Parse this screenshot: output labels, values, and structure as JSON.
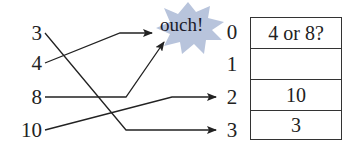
{
  "keys": [
    {
      "label": "3",
      "y": 33
    },
    {
      "label": "4",
      "y": 63
    },
    {
      "label": "8",
      "y": 97
    },
    {
      "label": "10",
      "y": 130
    }
  ],
  "callout": {
    "label": "ouch!",
    "color": "#b8c4dc"
  },
  "indices": [
    "0",
    "1",
    "2",
    "3"
  ],
  "table": {
    "cells": [
      "4 or 8?",
      "",
      "10",
      "3"
    ]
  },
  "mappings": [
    {
      "from": "3",
      "to": "3"
    },
    {
      "from": "4",
      "to": "0 (ouch!)"
    },
    {
      "from": "8",
      "to": "0 (ouch!)"
    },
    {
      "from": "10",
      "to": "2"
    }
  ]
}
